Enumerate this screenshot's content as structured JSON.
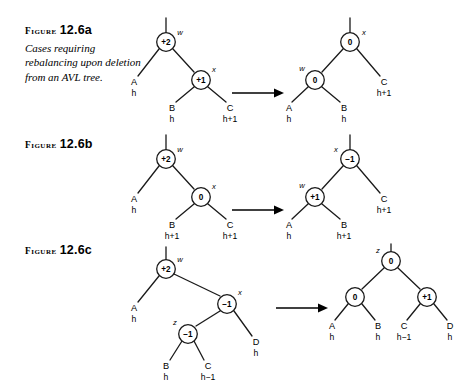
{
  "page": {
    "background": "#ffffff",
    "ink": "#1a1a1a"
  },
  "panels": [
    {
      "id": "a",
      "caption": {
        "figure_word": "Figure",
        "number": "12.6a",
        "description": "Cases requiring rebalancing upon deletion from an AVL tree."
      },
      "arrow": {
        "label": ""
      },
      "before": {
        "nodes": [
          {
            "id": "w",
            "balance": "+2",
            "name": "w",
            "name_side": "right"
          },
          {
            "id": "x",
            "balance": "+1",
            "name": "x",
            "name_side": "right"
          }
        ],
        "subtrees": [
          {
            "label": "A",
            "height": "h"
          },
          {
            "label": "B",
            "height": "h"
          },
          {
            "label": "C",
            "height": "h+1"
          }
        ]
      },
      "after": {
        "nodes": [
          {
            "id": "x",
            "balance": "0",
            "name": "x",
            "name_side": "right"
          },
          {
            "id": "w",
            "balance": "0",
            "name": "w",
            "name_side": "left"
          }
        ],
        "subtrees": [
          {
            "label": "A",
            "height": "h"
          },
          {
            "label": "B",
            "height": "h"
          },
          {
            "label": "C",
            "height": "h+1"
          }
        ]
      }
    },
    {
      "id": "b",
      "caption": {
        "figure_word": "Figure",
        "number": "12.6b",
        "description": ""
      },
      "arrow": {
        "label": ""
      },
      "before": {
        "nodes": [
          {
            "id": "w",
            "balance": "+2",
            "name": "w",
            "name_side": "right"
          },
          {
            "id": "x",
            "balance": "0",
            "name": "x",
            "name_side": "right"
          }
        ],
        "subtrees": [
          {
            "label": "A",
            "height": "h"
          },
          {
            "label": "B",
            "height": "h+1"
          },
          {
            "label": "C",
            "height": "h+1"
          }
        ]
      },
      "after": {
        "nodes": [
          {
            "id": "x",
            "balance": "−1",
            "name": "x",
            "name_side": "left"
          },
          {
            "id": "w",
            "balance": "+1",
            "name": "w",
            "name_side": "left"
          }
        ],
        "subtrees": [
          {
            "label": "A",
            "height": "h"
          },
          {
            "label": "B",
            "height": "h+1"
          },
          {
            "label": "C",
            "height": "h+1"
          }
        ]
      }
    },
    {
      "id": "c",
      "caption": {
        "figure_word": "Figure",
        "number": "12.6c",
        "description": ""
      },
      "arrow": {
        "label": ""
      },
      "before": {
        "nodes": [
          {
            "id": "w",
            "balance": "+2",
            "name": "w",
            "name_side": "right"
          },
          {
            "id": "x",
            "balance": "−1",
            "name": "x",
            "name_side": "right"
          },
          {
            "id": "z",
            "balance": "−1",
            "name": "z",
            "name_side": "left"
          }
        ],
        "subtrees": [
          {
            "label": "A",
            "height": "h"
          },
          {
            "label": "B",
            "height": "h"
          },
          {
            "label": "C",
            "height": "h−1"
          },
          {
            "label": "D",
            "height": "h"
          }
        ]
      },
      "after": {
        "nodes": [
          {
            "id": "z",
            "balance": "0",
            "name": "z",
            "name_side": "left"
          },
          {
            "id": "w",
            "balance": "0",
            "name": "",
            "name_side": "left"
          },
          {
            "id": "x",
            "balance": "+1",
            "name": "",
            "name_side": "right"
          }
        ],
        "subtrees": [
          {
            "label": "A",
            "height": "h"
          },
          {
            "label": "B",
            "height": "h"
          },
          {
            "label": "C",
            "height": "h−1"
          },
          {
            "label": "D",
            "height": "h"
          }
        ]
      }
    }
  ]
}
